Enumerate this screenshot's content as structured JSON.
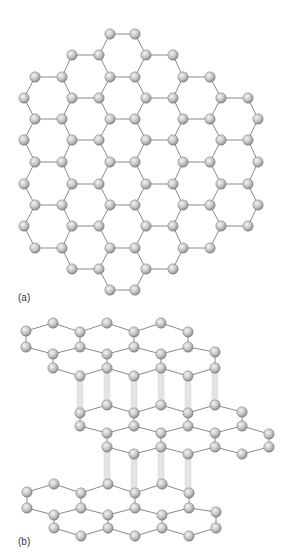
{
  "figure": {
    "panel_a": {
      "label": "(a)",
      "title": "Graphene sheet (top view)",
      "rows": [
        {
          "y": 34,
          "xs": [
            110,
            135
          ]
        },
        {
          "y": 55,
          "xs": [
            72,
            99,
            146,
            173
          ]
        },
        {
          "y": 77,
          "xs": [
            35,
            62,
            110,
            135,
            183,
            210
          ]
        },
        {
          "y": 98,
          "xs": [
            24,
            72,
            99,
            146,
            173,
            221,
            248
          ]
        },
        {
          "y": 119,
          "xs": [
            35,
            62,
            110,
            135,
            183,
            210,
            258
          ]
        },
        {
          "y": 140,
          "xs": [
            24,
            72,
            99,
            146,
            173,
            221,
            248
          ]
        },
        {
          "y": 162,
          "xs": [
            35,
            62,
            110,
            135,
            183,
            210,
            258
          ]
        },
        {
          "y": 184,
          "xs": [
            24,
            72,
            99,
            146,
            173,
            221,
            248
          ]
        },
        {
          "y": 205,
          "xs": [
            35,
            62,
            110,
            135,
            183,
            210,
            258
          ]
        },
        {
          "y": 226,
          "xs": [
            24,
            72,
            99,
            146,
            173,
            221,
            248
          ]
        },
        {
          "y": 248,
          "xs": [
            35,
            62,
            110,
            135,
            183,
            210
          ]
        },
        {
          "y": 269,
          "xs": [
            72,
            99,
            146,
            173
          ]
        },
        {
          "y": 290,
          "xs": [
            110,
            135
          ]
        }
      ]
    },
    "panel_b": {
      "label": "(b)",
      "title": "Stacked graphite layers",
      "layers": [
        {
          "name": "top",
          "rows": [
            [
              [
                26,
                331
              ],
              [
                53,
                323
              ],
              [
                80,
                332
              ],
              [
                107,
                323
              ],
              [
                134,
                332
              ],
              [
                161,
                323
              ],
              [
                188,
                332
              ]
            ],
            [
              [
                26,
                347
              ],
              [
                53,
                354
              ],
              [
                80,
                347
              ],
              [
                107,
                354
              ],
              [
                134,
                347
              ],
              [
                161,
                354
              ],
              [
                188,
                347
              ],
              [
                215,
                352
              ]
            ],
            [
              [
                53,
                368
              ],
              [
                80,
                376
              ],
              [
                107,
                368
              ],
              [
                134,
                376
              ],
              [
                161,
                368
              ],
              [
                188,
                376
              ],
              [
                215,
                368
              ]
            ]
          ]
        },
        {
          "name": "middle",
          "rows": [
            [
              [
                80,
                413
              ],
              [
                107,
                405
              ],
              [
                134,
                413
              ],
              [
                161,
                405
              ],
              [
                188,
                413
              ],
              [
                215,
                405
              ],
              [
                242,
                412
              ]
            ],
            [
              [
                80,
                426
              ],
              [
                107,
                433
              ],
              [
                134,
                426
              ],
              [
                161,
                433
              ],
              [
                188,
                426
              ],
              [
                215,
                433
              ],
              [
                242,
                426
              ],
              [
                269,
                434
              ]
            ],
            [
              [
                107,
                447
              ],
              [
                134,
                454
              ],
              [
                161,
                447
              ],
              [
                188,
                454
              ],
              [
                215,
                447
              ],
              [
                242,
                454
              ],
              [
                269,
                447
              ]
            ]
          ]
        },
        {
          "name": "bottom",
          "rows": [
            [
              [
                27,
                492
              ],
              [
                54,
                484
              ],
              [
                81,
                493
              ],
              [
                108,
                484
              ],
              [
                135,
                493
              ],
              [
                162,
                484
              ],
              [
                189,
                493
              ]
            ],
            [
              [
                27,
                508
              ],
              [
                54,
                515
              ],
              [
                81,
                508
              ],
              [
                108,
                515
              ],
              [
                135,
                508
              ],
              [
                162,
                515
              ],
              [
                189,
                508
              ],
              [
                216,
                512
              ]
            ],
            [
              [
                54,
                528
              ],
              [
                81,
                536
              ],
              [
                108,
                528
              ],
              [
                135,
                536
              ],
              [
                162,
                528
              ],
              [
                189,
                536
              ],
              [
                216,
                528
              ]
            ]
          ]
        }
      ],
      "pillars": [
        {
          "x": 80,
          "y1": 376,
          "y2": 413
        },
        {
          "x": 107,
          "y1": 368,
          "y2": 405
        },
        {
          "x": 134,
          "y1": 376,
          "y2": 413
        },
        {
          "x": 161,
          "y1": 368,
          "y2": 405
        },
        {
          "x": 188,
          "y1": 376,
          "y2": 413
        },
        {
          "x": 215,
          "y1": 368,
          "y2": 405
        },
        {
          "x": 107,
          "y1": 447,
          "y2": 484
        },
        {
          "x": 134,
          "y1": 454,
          "y2": 493
        },
        {
          "x": 161,
          "y1": 447,
          "y2": 484
        },
        {
          "x": 188,
          "y1": 454,
          "y2": 493
        }
      ]
    },
    "colors": {
      "atom": "#c8c8c8",
      "atom_edge": "#7a7a7a",
      "bond": "#8a8a8a",
      "pillar": "#e4e4e4"
    }
  }
}
